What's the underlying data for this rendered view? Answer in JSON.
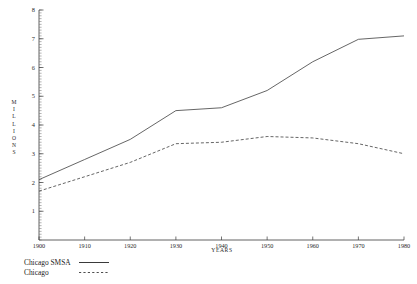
{
  "chart_data": {
    "type": "line",
    "title": "",
    "xlabel": "YEARS",
    "ylabel": "MILLIONS",
    "xlim": [
      1900,
      1980
    ],
    "ylim": [
      0,
      8
    ],
    "grid": false,
    "legend_position": "below-left",
    "x": [
      1900,
      1910,
      1920,
      1930,
      1940,
      1950,
      1960,
      1970,
      1980
    ],
    "xticks": [
      "1900",
      "1910",
      "1920",
      "1930",
      "1940",
      "1950",
      "1960",
      "1970",
      "1980"
    ],
    "yticks": [
      "1",
      "2",
      "3",
      "4",
      "5",
      "6",
      "7",
      "8"
    ],
    "series": [
      {
        "name": "Chicago SMSA",
        "style": "solid",
        "values": [
          2.1,
          2.8,
          3.5,
          4.5,
          4.6,
          5.2,
          6.2,
          6.98,
          7.1
        ]
      },
      {
        "name": "Chicago",
        "style": "dashed",
        "values": [
          1.7,
          2.2,
          2.7,
          3.35,
          3.4,
          3.6,
          3.55,
          3.35,
          3.0
        ]
      }
    ]
  },
  "legend": {
    "items": [
      {
        "label": "Chicago SMSA",
        "style": "solid"
      },
      {
        "label": "Chicago",
        "style": "dashed"
      }
    ]
  },
  "footnote": {
    "text": ""
  }
}
